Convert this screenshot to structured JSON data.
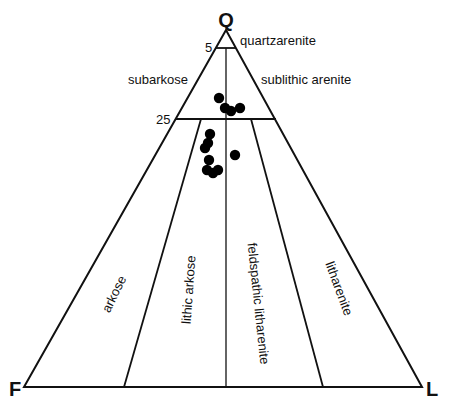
{
  "chart_data": {
    "type": "scatter",
    "subtype": "ternary",
    "title": "",
    "vertices": {
      "top": "Q",
      "left": "F",
      "right": "L"
    },
    "boundary_ticks": [
      {
        "label": "5",
        "Q_percent": 95
      },
      {
        "label": "25",
        "Q_percent": 75
      }
    ],
    "fields": [
      {
        "name": "quartzarenite",
        "region": "Q > 95%"
      },
      {
        "name": "subarkose",
        "region": "75–95% Q, F > L"
      },
      {
        "name": "sublithic arenite",
        "region": "75–95% Q, L > F"
      },
      {
        "name": "arkose",
        "region": "Q < 75%, F/(F+L) > 0.75"
      },
      {
        "name": "lithic arkose",
        "region": "Q < 75%, F/(F+L) 0.5–0.75"
      },
      {
        "name": "feldspathic litharenite",
        "region": "Q < 75%, F/(F+L) 0.25–0.5"
      },
      {
        "name": "litharenite",
        "region": "Q < 75%, F/(F+L) < 0.25"
      }
    ],
    "series": [
      {
        "name": "samples",
        "marker": "filled-circle",
        "color": "#000000",
        "points": [
          {
            "Q": 81,
            "F": 10,
            "L": 9
          },
          {
            "Q": 78,
            "F": 11,
            "L": 11
          },
          {
            "Q": 77,
            "F": 10,
            "L": 13
          },
          {
            "Q": 78,
            "F": 8,
            "L": 14
          },
          {
            "Q": 71,
            "F": 18,
            "L": 11
          },
          {
            "Q": 68,
            "F": 20,
            "L": 12
          },
          {
            "Q": 67,
            "F": 21,
            "L": 12
          },
          {
            "Q": 64,
            "F": 22,
            "L": 14
          },
          {
            "Q": 61,
            "F": 24,
            "L": 15
          },
          {
            "Q": 60,
            "F": 23,
            "L": 17
          },
          {
            "Q": 61,
            "F": 21,
            "L": 18
          },
          {
            "Q": 65,
            "F": 15,
            "L": 20
          }
        ]
      }
    ],
    "grid": false,
    "legend": null
  },
  "labels": {
    "q": "Q",
    "f": "F",
    "l": "L",
    "tick5": "5",
    "tick25": "25",
    "quartzarenite": "quartzarenite",
    "subarkose": "subarkose",
    "sublithic": "sublithic arenite",
    "arkose": "arkose",
    "lithic_arkose": "lithic arkose",
    "feldspathic_litharenite": "feldspathic litharenite",
    "litharenite": "litharenite"
  },
  "points_px": [
    [
      219,
      98
    ],
    [
      225,
      108
    ],
    [
      231,
      111
    ],
    [
      240,
      108
    ],
    [
      210,
      134
    ],
    [
      208,
      143
    ],
    [
      205,
      148
    ],
    [
      209,
      160
    ],
    [
      207,
      170
    ],
    [
      213,
      173
    ],
    [
      218,
      170
    ],
    [
      235,
      155
    ]
  ]
}
